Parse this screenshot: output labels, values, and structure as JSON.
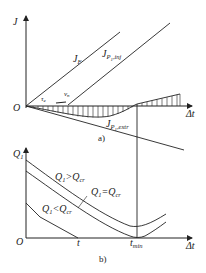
{
  "diagram": {
    "panel_a": {
      "caption": "a)",
      "y_axis_label": "J",
      "x_axis_label": "Δt",
      "origin_label": "O",
      "curves": [
        {
          "name": "J_F",
          "label_main": "J",
          "label_sub": "F"
        },
        {
          "name": "J_P1_inj",
          "label_main": "J",
          "label_sub": "P",
          "label_sub2": "1",
          "label_sub3": ",inj"
        },
        {
          "name": "J_P1_extr",
          "label_main": "J",
          "label_sub": "P",
          "label_sub2": "1",
          "label_sub3": ",extr"
        }
      ],
      "annotations": {
        "tau": "τ",
        "tau_sub": "e",
        "nu": "ν",
        "nu_sub": "n"
      }
    },
    "panel_b": {
      "caption": "b)",
      "y_axis_label": "Q",
      "y_axis_sub": "1",
      "x_axis_label": "Δt",
      "origin_label": "O",
      "tick_t": "t",
      "tick_tmin": "t",
      "tick_tmin_sub": "min",
      "curves": [
        {
          "name": "Q1>Qcr",
          "label": "Q",
          "sub1": "1",
          "op": ">",
          "label2": "Q",
          "sub2": "cr"
        },
        {
          "name": "Q1=Qcr",
          "label": "Q",
          "sub1": "1",
          "op": "=",
          "label2": "Q",
          "sub2": "cr"
        },
        {
          "name": "Q1<Qcr",
          "label": "Q",
          "sub1": "1",
          "op": "<",
          "label2": "Q",
          "sub2": "cr"
        }
      ]
    }
  }
}
